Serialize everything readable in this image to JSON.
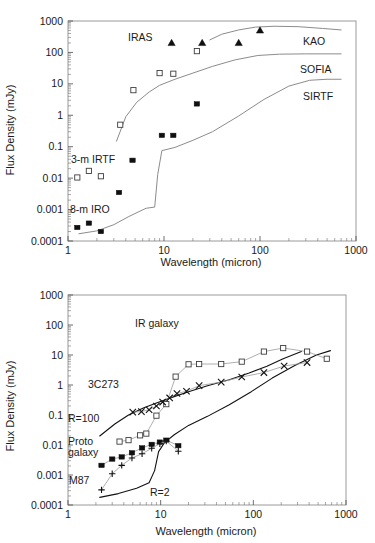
{
  "figure": {
    "axis": {
      "xlabel": "Wavelength (micron)",
      "ylabel": "Flux Density (mJy)",
      "xticks": [
        "1",
        "10",
        "100",
        "1000"
      ],
      "yticks_top": [
        "0.0001",
        "0.001",
        "0.01",
        "0.1",
        "1",
        "10",
        "100",
        "1000"
      ],
      "yticks_bottom": [
        "0.0001",
        "0.001",
        "0.01",
        "0.1",
        "1",
        "10",
        "100",
        "1000"
      ]
    }
  },
  "chart_data": [
    {
      "type": "scatter",
      "panel": "top",
      "title": "",
      "xlabel": "Wavelength (micron)",
      "ylabel": "Flux Density (mJy)",
      "xscale": "log",
      "yscale": "log",
      "xlim": [
        1,
        1000
      ],
      "ylim": [
        0.0001,
        1000
      ],
      "grid": false,
      "legend": "inline-annotations",
      "annotations": [
        "IRAS",
        "KAO",
        "SOFIA",
        "SIRTF",
        "3-m IRTF",
        "8-m IRO"
      ],
      "series": [
        {
          "name": "IRAS",
          "marker": "filled-triangle",
          "x": [
            12,
            25,
            60,
            100
          ],
          "y": [
            200,
            200,
            200,
            500
          ]
        },
        {
          "name": "3-m IRTF",
          "marker": "open-square",
          "x": [
            1.25,
            1.65,
            2.2,
            3.5,
            4.8,
            9.0,
            12.5,
            22.0
          ],
          "y": [
            0.0105,
            0.017,
            0.0115,
            0.5,
            6.3,
            22,
            21,
            110
          ]
        },
        {
          "name": "8-m IRO",
          "marker": "filled-square",
          "x": [
            1.25,
            1.65,
            2.2,
            3.4,
            4.7,
            9.5,
            12.5,
            22.0
          ],
          "y": [
            0.00027,
            0.00037,
            0.0002,
            0.0035,
            0.037,
            0.23,
            0.23,
            2.3
          ]
        },
        {
          "name": "KAO",
          "marker": "line",
          "x": [
            30,
            40,
            60,
            90,
            140,
            250,
            450,
            700
          ],
          "y": [
            250,
            380,
            520,
            640,
            680,
            660,
            580,
            520
          ]
        },
        {
          "name": "SOFIA",
          "marker": "line",
          "x": [
            3.2,
            4.0,
            5.2,
            7.0,
            9.0,
            13,
            20,
            32,
            55,
            95,
            160,
            300,
            700
          ],
          "y": [
            0.15,
            0.9,
            2.6,
            5.5,
            9.0,
            14,
            22,
            36,
            58,
            80,
            88,
            90,
            90
          ]
        },
        {
          "name": "SIRTF",
          "marker": "line",
          "x": [
            1.3,
            2.0,
            3.0,
            4.3,
            6.5,
            8.0,
            8.6,
            9.5,
            13,
            20,
            32,
            60,
            110,
            200,
            330,
            500,
            700
          ],
          "y": [
            0.00017,
            0.00021,
            0.00033,
            0.0006,
            0.0011,
            0.0012,
            0.013,
            0.075,
            0.095,
            0.16,
            0.3,
            0.95,
            3.2,
            8.5,
            13,
            14,
            14
          ]
        }
      ]
    },
    {
      "type": "scatter",
      "panel": "bottom",
      "title": "",
      "xlabel": "Wavelength (micron)",
      "ylabel": "Flux Density (mJy)",
      "xscale": "log",
      "yscale": "log",
      "xlim": [
        1,
        1000
      ],
      "ylim": [
        0.0001,
        1000
      ],
      "grid": false,
      "legend": "inline-annotations",
      "annotations": [
        "IR galaxy",
        "3C273",
        "R=100",
        "Proto galaxy",
        "M87",
        "R=2"
      ],
      "series": [
        {
          "name": "IR galaxy",
          "marker": "open-square",
          "x": [
            3.6,
            4.5,
            6.0,
            7.0,
            9.0,
            11.5,
            14.5,
            20,
            26,
            45,
            75,
            130,
            210,
            380,
            620
          ],
          "y": [
            0.013,
            0.0145,
            0.021,
            0.024,
            0.095,
            0.23,
            1.9,
            4.9,
            5.0,
            5.0,
            6.0,
            13,
            17,
            13,
            7.5
          ]
        },
        {
          "name": "3C273",
          "marker": "cross",
          "x": [
            5.0,
            6.2,
            7.5,
            9.0,
            10.5,
            12.5,
            15,
            19,
            26,
            45,
            75,
            130,
            215,
            380
          ],
          "y": [
            0.125,
            0.13,
            0.15,
            0.2,
            0.27,
            0.37,
            0.52,
            0.62,
            0.95,
            1.25,
            1.85,
            2.6,
            4.3,
            5.6
          ]
        },
        {
          "name": "Proto galaxy",
          "marker": "filled-square",
          "x": [
            2.3,
            3.0,
            3.8,
            4.9,
            6.3,
            8.0,
            9.8,
            11.5,
            15.5
          ],
          "y": [
            0.0021,
            0.0034,
            0.004,
            0.0055,
            0.008,
            0.0105,
            0.0125,
            0.0145,
            0.0095
          ]
        },
        {
          "name": "M87",
          "marker": "plus",
          "x": [
            2.3,
            3.0,
            3.8,
            4.9,
            6.3,
            8.0,
            9.8,
            11.5,
            15.5
          ],
          "y": [
            0.00032,
            0.0011,
            0.0021,
            0.0037,
            0.0051,
            0.0078,
            0.011,
            0.0135,
            0.0062
          ]
        },
        {
          "name": "R=100",
          "marker": "line",
          "x": [
            2.2,
            3.2,
            4.5,
            6.5,
            9.0,
            13,
            20,
            32,
            55,
            90,
            140,
            210,
            330
          ],
          "y": [
            0.02,
            0.05,
            0.1,
            0.17,
            0.25,
            0.38,
            0.6,
            0.95,
            1.5,
            2.5,
            4.2,
            7.5,
            13
          ]
        },
        {
          "name": "R=2",
          "marker": "line",
          "x": [
            2.2,
            3.5,
            5.5,
            7.5,
            8.6,
            9.5,
            11,
            14,
            20,
            32,
            55,
            95,
            160,
            280,
            480,
            680
          ],
          "y": [
            0.00018,
            0.00024,
            0.00036,
            0.00055,
            0.0014,
            0.006,
            0.012,
            0.022,
            0.045,
            0.09,
            0.22,
            0.6,
            1.7,
            4.5,
            10,
            14
          ]
        }
      ]
    }
  ],
  "labels": {
    "top": {
      "iras": "IRAS",
      "kao": "KAO",
      "sofia": "SOFIA",
      "sirtf": "SIRTF",
      "irtf": "3-m IRTF",
      "iro": "8-m IRO"
    },
    "bottom": {
      "ir_galaxy": "IR galaxy",
      "q3c273": "3C273",
      "r100": "R=100",
      "proto": "Proto",
      "galaxy": "galaxy",
      "m87": "M87",
      "r2": "R=2"
    }
  }
}
